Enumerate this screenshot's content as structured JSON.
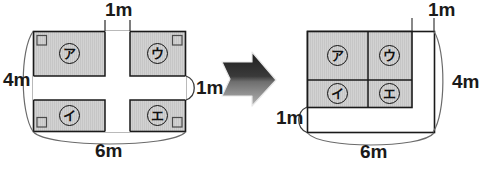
{
  "figure": {
    "title": "",
    "colors": {
      "shaded_fill": "#cfcfcf",
      "outline": "#1a1a1a",
      "background": "#ffffff",
      "arrow_dark": "#2b2b2b",
      "arrow_light": "#8c8c8c"
    },
    "left_diagram": {
      "name": "original-field-with-paths",
      "overall_width_label": "6m",
      "overall_height_label": "4m",
      "path_width_top_label": "1m",
      "path_width_right_label": "1m",
      "cells": [
        {
          "id": "a",
          "label": "ア",
          "position": "top-left"
        },
        {
          "id": "u",
          "label": "ウ",
          "position": "top-right"
        },
        {
          "id": "i",
          "label": "イ",
          "position": "bottom-left"
        },
        {
          "id": "e",
          "label": "エ",
          "position": "bottom-right"
        }
      ]
    },
    "right_diagram": {
      "name": "rearranged-field",
      "overall_width_label": "6m",
      "overall_height_label": "4m",
      "gap_top_label": "1m",
      "gap_left_label": "1m",
      "cells": [
        {
          "id": "a",
          "label": "ア",
          "position": "top-left"
        },
        {
          "id": "u",
          "label": "ウ",
          "position": "top-right"
        },
        {
          "id": "i",
          "label": "イ",
          "position": "bottom-left"
        },
        {
          "id": "e",
          "label": "エ",
          "position": "bottom-right"
        }
      ]
    },
    "arrow": {
      "name": "transformation-arrow",
      "direction": "right"
    }
  }
}
